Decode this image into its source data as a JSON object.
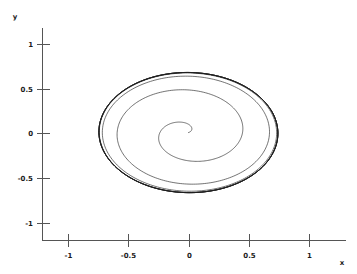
{
  "chart_data": {
    "type": "line",
    "title": "",
    "subtitle": "",
    "xlabel": "x",
    "ylabel": "y",
    "xlim": [
      -1.35,
      1.35
    ],
    "ylim": [
      -1.35,
      1.35
    ],
    "grid": false,
    "legend": null,
    "x_ticks": [
      {
        "value": -1,
        "label": "-1",
        "px": 68
      },
      {
        "value": -0.5,
        "label": "-0.5",
        "px": 128
      },
      {
        "value": 0,
        "label": "0",
        "px": 189
      },
      {
        "value": 0.5,
        "label": "0.5",
        "px": 249
      },
      {
        "value": 1,
        "label": "1",
        "px": 310
      }
    ],
    "y_ticks": [
      {
        "value": 1,
        "label": "1",
        "px": 44
      },
      {
        "value": 0.5,
        "label": "0.5",
        "px": 89
      },
      {
        "value": 0,
        "label": "0",
        "px": 133
      },
      {
        "value": -0.5,
        "label": "-0.5",
        "px": 178
      },
      {
        "value": -1,
        "label": "-1",
        "px": 223
      }
    ],
    "series": [
      {
        "name": "phase-trajectory",
        "description": "Spiral trajectory expanding from the origin outward onto a closed elliptical limit cycle",
        "color": "#1d1d1d",
        "start_point": [
          0.0,
          0.0
        ],
        "limit_cycle": {
          "center": [
            -0.005,
            0.005
          ],
          "semi_axis_x": 0.74,
          "semi_axis_y": 0.675,
          "tilt_deg": -4
        },
        "turns": 9,
        "spiral_growth_per_turn": 0.082
      }
    ],
    "annotations": []
  },
  "axes": {
    "y_axis_label": "y",
    "x_axis_label": "x"
  }
}
